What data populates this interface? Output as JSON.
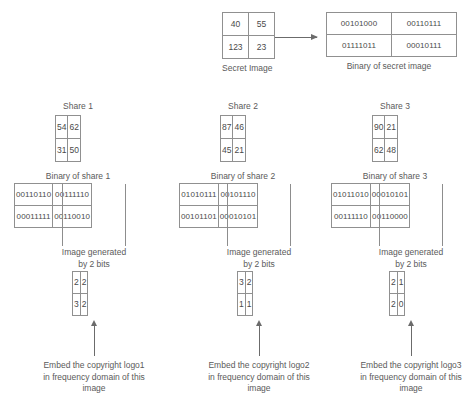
{
  "secret": {
    "caption": "Secret Image",
    "values": [
      [
        "40",
        "55"
      ],
      [
        "123",
        "23"
      ]
    ]
  },
  "secret_binary": {
    "caption": "Binary of secret image",
    "values": [
      [
        "00101000",
        "00110111"
      ],
      [
        "01111011",
        "00010111"
      ]
    ]
  },
  "shares": [
    {
      "title": "Share 1",
      "values": [
        [
          "54",
          "62"
        ],
        [
          "31",
          "50"
        ]
      ],
      "binary_caption": "Binary of share 1",
      "binary_values": [
        [
          "00110110",
          "00111110"
        ],
        [
          "00011111",
          "00110010"
        ]
      ],
      "generated_caption_line1": "Image generated",
      "generated_caption_line2": "by 2 bits",
      "generated_values": [
        [
          "2",
          "2"
        ],
        [
          "3",
          "2"
        ]
      ],
      "embed_caption": "Embed the copyright logo1 in frequency domain of this image"
    },
    {
      "title": "Share 2",
      "values": [
        [
          "87",
          "46"
        ],
        [
          "45",
          "21"
        ]
      ],
      "binary_caption": "Binary of share 2",
      "binary_values": [
        [
          "01010111",
          "00101110"
        ],
        [
          "00101101",
          "00010101"
        ]
      ],
      "generated_caption_line1": "Image generated",
      "generated_caption_line2": "by 2 bits",
      "generated_values": [
        [
          "3",
          "2"
        ],
        [
          "1",
          "1"
        ]
      ],
      "embed_caption": "Embed the copyright logo2 in frequency domain of this image"
    },
    {
      "title": "Share 3",
      "values": [
        [
          "90",
          "21"
        ],
        [
          "62",
          "48"
        ]
      ],
      "binary_caption": "Binary of share 3",
      "binary_values": [
        [
          "01011010",
          "00010101"
        ],
        [
          "00111110",
          "00110000"
        ]
      ],
      "generated_caption_line1": "Image generated",
      "generated_caption_line2": "by 2 bits",
      "generated_values": [
        [
          "2",
          "1"
        ],
        [
          "2",
          "0"
        ]
      ],
      "embed_caption": "Embed the copyright logo3 in frequency domain of this image"
    }
  ],
  "colors": {
    "border": "#909090",
    "text": "#4a4a4a",
    "arrow": "#6b6b6b",
    "background": "#ffffff"
  }
}
